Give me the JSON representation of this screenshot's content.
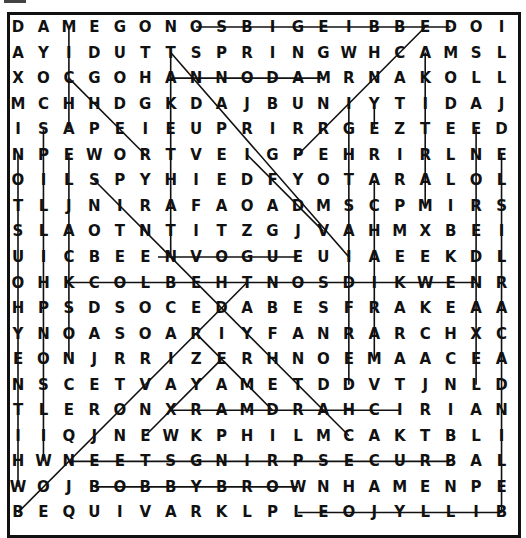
{
  "puzzle": {
    "type": "word-search",
    "rows": 20,
    "cols": 20,
    "grid": [
      "DAMEGONOSBIGEIBBEDOI",
      "AYIDUTTSPRINGWHCAMSL",
      "XOCGOHANNODAMRNAKOLL",
      "MCHHDGKDAJBUNIYTIDAJ",
      "ISAPEIEUPRIRRGEZTEED",
      "NPEWORTVEIGPEHRIRLNE",
      "OILSPYHIEDFYOTARALOL",
      "TLJNIRAFAOADMSCPMIRS",
      "SLAOTNTITZGJVAHMXBEI",
      "UICBEENVOGUEUIAEEKDL",
      "OHKCOLBEHTNOSDIKWENR",
      "HPSDSOCEDABESFRAKEAA",
      "YNOASOARIYFANRARCHXC",
      "EONJRRIZERHNOEMAACEA",
      "NSCETVAYAMETDDVTJNLD",
      "TLERONXRAMDRAHCIRIAN",
      "IIQJNEWKPHILMCAKTBLI",
      "HWNEETSGNIRPSECURBAL",
      "WOJBOBBYBROWNHAMENPE",
      "BEQUIVARKLPLEOJYLLIB"
    ],
    "found_lines": [
      {
        "from": [
          0,
          7
        ],
        "to": [
          0,
          17
        ]
      },
      {
        "from": [
          2,
          12
        ],
        "to": [
          2,
          6
        ]
      },
      {
        "from": [
          9,
          5.5
        ],
        "to": [
          9,
          11
        ]
      },
      {
        "from": [
          10,
          2
        ],
        "to": [
          10,
          18
        ]
      },
      {
        "from": [
          15,
          6
        ],
        "to": [
          15,
          15
        ]
      },
      {
        "from": [
          17,
          17
        ],
        "to": [
          17,
          2
        ]
      },
      {
        "from": [
          18,
          3
        ],
        "to": [
          18,
          11
        ]
      },
      {
        "from": [
          19,
          19
        ],
        "to": [
          19,
          11
        ]
      },
      {
        "from": [
          4,
          2
        ],
        "to": [
          0,
          2
        ]
      },
      {
        "from": [
          5,
          0
        ],
        "to": [
          18,
          0
        ]
      },
      {
        "from": [
          4,
          1
        ],
        "to": [
          17,
          1
        ]
      },
      {
        "from": [
          13,
          2
        ],
        "to": [
          5,
          2
        ]
      },
      {
        "from": [
          1,
          6
        ],
        "to": [
          9,
          6
        ]
      },
      {
        "from": [
          1,
          6
        ],
        "to": [
          9,
          13
        ]
      },
      {
        "from": [
          2,
          2
        ],
        "to": [
          4,
          4
        ]
      },
      {
        "from": [
          4,
          4
        ],
        "to": [
          5,
          5
        ]
      },
      {
        "from": [
          6,
          3
        ],
        "to": [
          16,
          13
        ]
      },
      {
        "from": [
          5,
          9
        ],
        "to": [
          8,
          12
        ]
      },
      {
        "from": [
          0,
          16
        ],
        "to": [
          5,
          11
        ]
      },
      {
        "from": [
          3,
          13
        ],
        "to": [
          14,
          13
        ]
      },
      {
        "from": [
          4,
          14
        ],
        "to": [
          3,
          14
        ]
      },
      {
        "from": [
          13,
          14
        ],
        "to": [
          6,
          14
        ]
      },
      {
        "from": [
          7,
          16
        ],
        "to": [
          1,
          16
        ]
      },
      {
        "from": [
          4,
          18
        ],
        "to": [
          14,
          18
        ]
      },
      {
        "from": [
          5,
          19
        ],
        "to": [
          19,
          19
        ]
      },
      {
        "from": [
          19,
          0
        ],
        "to": [
          10,
          9
        ]
      },
      {
        "from": [
          16,
          5
        ],
        "to": [
          13,
          8
        ]
      },
      {
        "from": [
          12,
          7
        ],
        "to": [
          15,
          10
        ]
      }
    ]
  }
}
